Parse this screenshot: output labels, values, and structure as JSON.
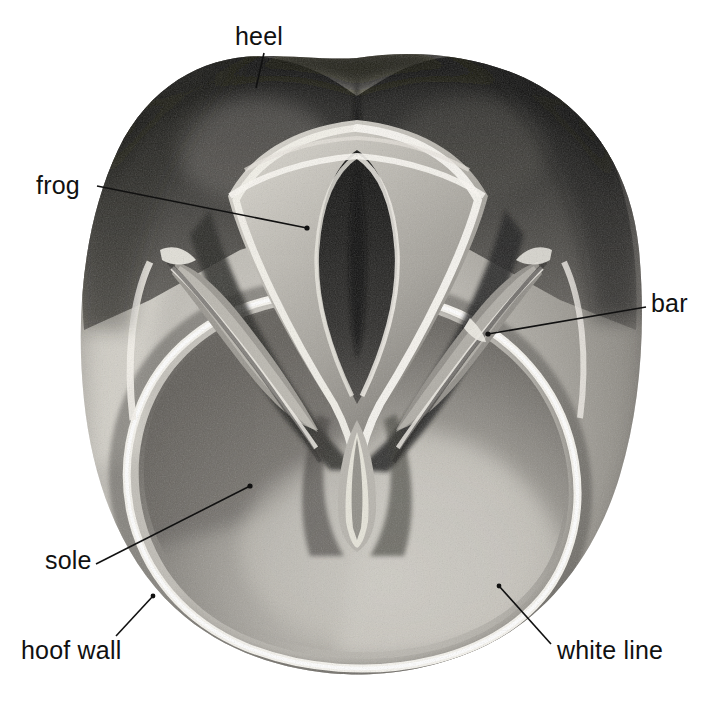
{
  "figure": {
    "caption": "",
    "background_color": "#ffffff",
    "ink_color": "#111111"
  },
  "labels": [
    {
      "id": "heel",
      "text": "heel",
      "text_pos": {
        "x": 235,
        "y": 24
      },
      "leader": {
        "x1": 264,
        "y1": 53,
        "x2": 256,
        "y2": 88
      }
    },
    {
      "id": "frog",
      "text": "frog",
      "text_pos": {
        "x": 36,
        "y": 173
      },
      "leader": {
        "x1": 97,
        "y1": 186,
        "x2": 307,
        "y2": 228
      }
    },
    {
      "id": "bar",
      "text": "bar",
      "text_pos": {
        "x": 651,
        "y": 291
      },
      "leader": {
        "x1": 646,
        "y1": 307,
        "x2": 488,
        "y2": 334
      }
    },
    {
      "id": "sole",
      "text": "sole",
      "text_pos": {
        "x": 45,
        "y": 548
      },
      "leader": {
        "x1": 96,
        "y1": 564,
        "x2": 250,
        "y2": 486
      }
    },
    {
      "id": "hoof-wall",
      "text": "hoof wall",
      "text_pos": {
        "x": 21,
        "y": 638
      },
      "leader": {
        "x1": 116,
        "y1": 636,
        "x2": 153,
        "y2": 596
      }
    },
    {
      "id": "white-line",
      "text": "white line",
      "text_pos": {
        "x": 557,
        "y": 638
      },
      "leader": {
        "x1": 551,
        "y1": 644,
        "x2": 499,
        "y2": 586
      }
    }
  ],
  "palette": {
    "paper": "#ffffff",
    "wall_light": "#c9c6bf",
    "wall_mid": "#a9a69f",
    "wall_dark": "#7d7a74",
    "sole_light": "#bdbab3",
    "sole_mid": "#8e8b85",
    "sole_dark": "#6b6863",
    "heel_dark": "#2b2a28",
    "frog_dark": "#3c3b38",
    "highlight": "#f6f4ee",
    "ink": "#111111"
  }
}
